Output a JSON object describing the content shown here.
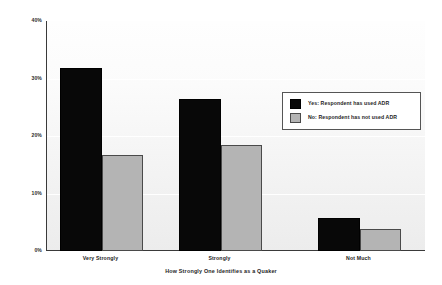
{
  "chart_data": {
    "type": "bar",
    "title": "",
    "subtitle": "",
    "xlabel": "How Strongly One Identifies as a Quaker",
    "ylabel": "",
    "categories": [
      "Very Strongly",
      "Strongly",
      "Not Much"
    ],
    "series": [
      {
        "name": "Yes: Respondent has used ADR",
        "color": "#080808",
        "values": [
          31.9,
          26.5,
          5.7
        ]
      },
      {
        "name": "No: Respondent has not used ADR",
        "color": "#b4b4b4",
        "values": [
          16.8,
          18.5,
          3.8
        ]
      }
    ],
    "ylim": [
      0,
      40
    ],
    "yticks": [
      0,
      10,
      20,
      30,
      40
    ],
    "ytick_labels": [
      "0%",
      "10%",
      "20%",
      "30%",
      "40%"
    ],
    "grid": true,
    "grid_axis": "y",
    "legend_position": "upper-right-inside",
    "legend_entries": [
      "Yes: Respondent has used ADR",
      "No: Respondent has not used ADR"
    ]
  },
  "axis": {
    "y": {
      "tick_0": "0%",
      "tick_1": "10%",
      "tick_2": "20%",
      "tick_3": "30%",
      "tick_4": "40%"
    },
    "x": {
      "title": "How Strongly One Identifies as a Quaker",
      "cat_0": "Very Strongly",
      "cat_1": "Strongly",
      "cat_2": "Not Much"
    }
  },
  "legend": {
    "entry_0": "Yes: Respondent has used ADR",
    "entry_1": "No: Respondent has not used ADR"
  },
  "colors": {
    "series_yes": "#080808",
    "series_no": "#b4b4b4",
    "axis": "#3a3a3a",
    "gridline": "#ffffff",
    "plot_background_top": "#fefefe",
    "plot_background_bottom": "#ececec",
    "canvas_background": "#ffffff"
  }
}
